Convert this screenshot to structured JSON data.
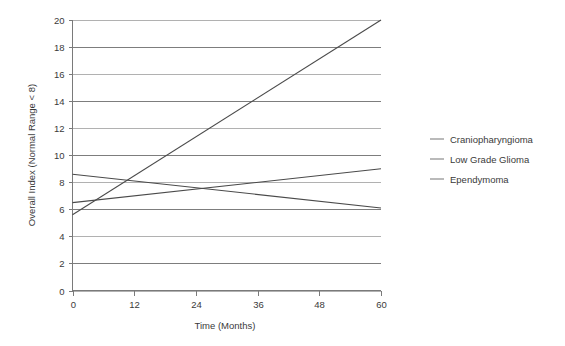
{
  "chart_data": {
    "type": "line",
    "title": "",
    "xlabel": "Time (Months)",
    "ylabel": "Overall Index (Normal Range < 8)",
    "x": [
      0,
      60
    ],
    "xlim": [
      0,
      60
    ],
    "ylim": [
      0,
      20
    ],
    "xticks": [
      0,
      12,
      24,
      36,
      48,
      60
    ],
    "yticks": [
      0,
      2,
      4,
      6,
      8,
      10,
      12,
      14,
      16,
      18,
      20
    ],
    "xtick_labels": [
      "0",
      "12",
      "24",
      "36",
      "48",
      "60"
    ],
    "ytick_labels": [
      "0",
      "2",
      "4",
      "6",
      "8",
      "10",
      "12",
      "14",
      "16",
      "18",
      "20"
    ],
    "grid": "horizontal",
    "legend_position": "right",
    "series": [
      {
        "name": "Craniopharyngioma",
        "color": "#4a4a4a",
        "points": [
          [
            0,
            5.6
          ],
          [
            60,
            20.0
          ]
        ],
        "values": [
          5.6,
          20.0
        ]
      },
      {
        "name": "Low Grade Glioma",
        "color": "#4a4a4a",
        "points": [
          [
            0,
            6.5
          ],
          [
            60,
            9.0
          ]
        ],
        "values": [
          6.5,
          9.0
        ]
      },
      {
        "name": "Ependymoma",
        "color": "#4a4a4a",
        "points": [
          [
            0,
            8.6
          ],
          [
            60,
            6.1
          ]
        ],
        "values": [
          8.6,
          6.1
        ]
      }
    ]
  },
  "axes": {
    "x_title": "Time (Months)",
    "y_title": "Overall Index (Normal Range < 8)"
  },
  "legend": {
    "items": [
      {
        "label": "Craniopharyngioma"
      },
      {
        "label": "Low Grade Glioma"
      },
      {
        "label": "Ependymoma"
      }
    ]
  },
  "colors": {
    "series": "#4a4a4a",
    "grid": "#6f6f6f",
    "grid_light": "#a8a8a8",
    "axis": "#7a7a7a",
    "text": "#3a3a3a",
    "background": "#ffffff"
  }
}
